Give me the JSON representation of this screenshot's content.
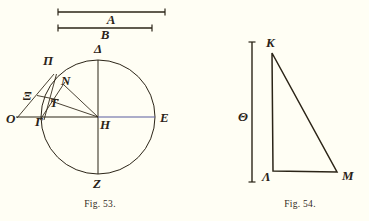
{
  "page": {
    "background_color": "#fffef4",
    "ink_color": "#2b2417",
    "accent_color": "#5a5c9e"
  },
  "figures": [
    {
      "id": "fig-53",
      "caption": "Fig. 53.",
      "caption_x": 100,
      "caption_y": 207,
      "rulers": [
        {
          "name": "segment-A",
          "label": "A",
          "x1": 58,
          "x2": 165,
          "y": 12,
          "label_x": 111,
          "label_y": 24
        },
        {
          "name": "segment-B",
          "label": "B",
          "x1": 58,
          "x2": 152,
          "y": 28,
          "label_x": 105,
          "label_y": 39
        }
      ],
      "circle": {
        "cx": 98,
        "cy": 117,
        "r": 57
      },
      "points": [
        {
          "name": "delta",
          "label": "Δ",
          "px": 98,
          "py": 60,
          "lx": 94,
          "ly": 50
        },
        {
          "name": "pi",
          "label": "Π",
          "px": 55,
          "py": 75,
          "lx": 45,
          "ly": 63
        },
        {
          "name": "nu",
          "label": "N",
          "px": 65,
          "py": 84,
          "lx": 61,
          "ly": 82
        },
        {
          "name": "xi",
          "label": "Ξ",
          "px": 45,
          "py": 97,
          "lx": 26,
          "ly": 96
        },
        {
          "name": "tau",
          "label": "T",
          "px": 55,
          "py": 102,
          "lx": 49,
          "ly": 105
        },
        {
          "name": "omicron",
          "label": "O",
          "px": 17,
          "py": 117,
          "lx": 8,
          "ly": 122
        },
        {
          "name": "gamma",
          "label": "Γ",
          "px": 43,
          "py": 117,
          "lx": 35,
          "ly": 124
        },
        {
          "name": "eta",
          "label": "H",
          "px": 98,
          "py": 117,
          "lx": 101,
          "ly": 128
        },
        {
          "name": "epsilon",
          "label": "E",
          "px": 155,
          "py": 117,
          "lx": 160,
          "ly": 121
        },
        {
          "name": "zeta",
          "label": "Z",
          "px": 98,
          "py": 174,
          "lx": 94,
          "ly": 187
        }
      ],
      "chords": [
        {
          "name": "vertical-diameter-delta-zeta",
          "x1": 98,
          "y1": 60,
          "x2": 98,
          "y2": 174
        },
        {
          "name": "horizontal-radius-omicron-eta",
          "x1": 17,
          "y1": 117,
          "x2": 98,
          "y2": 117
        },
        {
          "name": "horizontal-radius-eta-epsilon",
          "x1": 98,
          "y1": 117,
          "x2": 155,
          "y2": 117,
          "color": "accent"
        },
        {
          "name": "chord-eta-nu",
          "x1": 98,
          "y1": 117,
          "x2": 64,
          "y2": 85
        },
        {
          "name": "chord-eta-tau",
          "x1": 98,
          "y1": 117,
          "x2": 51,
          "y2": 101
        },
        {
          "name": "line-omicron-pi",
          "x1": 17,
          "y1": 117,
          "x2": 54,
          "y2": 74
        },
        {
          "name": "line-gamma-pi",
          "x1": 43,
          "y1": 119,
          "x2": 56,
          "y2": 74
        },
        {
          "name": "line-gamma-nu",
          "x1": 40,
          "y1": 119,
          "x2": 65,
          "y2": 82
        },
        {
          "name": "line-xi-tau",
          "x1": 38,
          "y1": 96,
          "x2": 58,
          "y2": 100
        }
      ]
    },
    {
      "id": "fig-54",
      "caption": "Fig. 54.",
      "caption_x": 300,
      "caption_y": 207,
      "rulers": [
        {
          "name": "segment-Theta",
          "label": "Θ",
          "x": 252,
          "y1": 42,
          "y2": 182,
          "label_x": 245,
          "label_y": 117
        }
      ],
      "points": [
        {
          "name": "kappa",
          "label": "K",
          "px": 272,
          "py": 53,
          "lx": 267,
          "ly": 43
        },
        {
          "name": "lambda",
          "label": "Λ",
          "px": 273,
          "py": 171,
          "lx": 265,
          "ly": 181
        },
        {
          "name": "mu",
          "label": "M",
          "px": 337,
          "py": 172,
          "lx": 342,
          "ly": 178
        }
      ],
      "triangle": {
        "name": "triangle-kappa-lambda-mu",
        "vertices": "272,53 273,171 337,172"
      }
    }
  ]
}
